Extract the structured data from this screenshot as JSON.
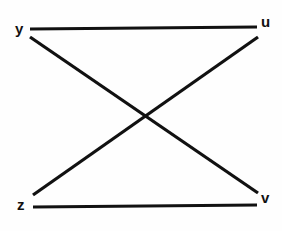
{
  "figure": {
    "kind": "bipartite-graph-diagram",
    "background_color": "#fefefe",
    "stroke_color": "#111111",
    "width": 282,
    "height": 231
  },
  "vertices": [
    {
      "id": "y",
      "label": "y",
      "position": "top-left",
      "x": 30,
      "y": 29
    },
    {
      "id": "u",
      "label": "u",
      "position": "top-right",
      "x": 257,
      "y": 28
    },
    {
      "id": "z",
      "label": "z",
      "position": "bottom-left",
      "x": 33,
      "y": 206
    },
    {
      "id": "v",
      "label": "v",
      "position": "bottom-right",
      "x": 257,
      "y": 205
    }
  ],
  "edges": [
    {
      "id": "edge-y-u",
      "from": "y",
      "to": "u",
      "style": "horizontal",
      "x1": 30,
      "y1": 29,
      "x2": 257,
      "y2": 27
    },
    {
      "id": "edge-z-v",
      "from": "z",
      "to": "v",
      "style": "horizontal",
      "x1": 33,
      "y1": 207,
      "x2": 257,
      "y2": 205
    },
    {
      "id": "edge-y-v",
      "from": "y",
      "to": "v",
      "style": "diagonal",
      "x1": 30,
      "y1": 37,
      "x2": 258,
      "y2": 193
    },
    {
      "id": "edge-z-u",
      "from": "z",
      "to": "u",
      "style": "diagonal",
      "x1": 33,
      "y1": 195,
      "x2": 258,
      "y2": 37
    }
  ],
  "crossing_point": {
    "x": 147,
    "y": 117
  }
}
